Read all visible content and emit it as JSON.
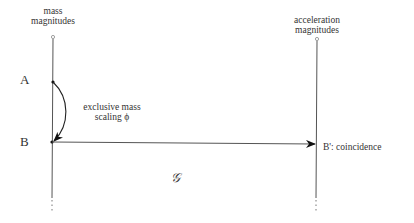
{
  "diagram": {
    "left_axis": {
      "title_line1": "mass",
      "title_line2": "magnitudes"
    },
    "right_axis": {
      "title_line1": "acceleration",
      "title_line2": "magnitudes"
    },
    "points": {
      "a": "A",
      "b": "B",
      "b_prime": "B': coincidence"
    },
    "curve_label_line1": "exclusive mass",
    "curve_label_line2": "scaling ϕ",
    "map_label": "𝒢",
    "colors": {
      "line": "#555555",
      "arrow": "#111111"
    }
  }
}
